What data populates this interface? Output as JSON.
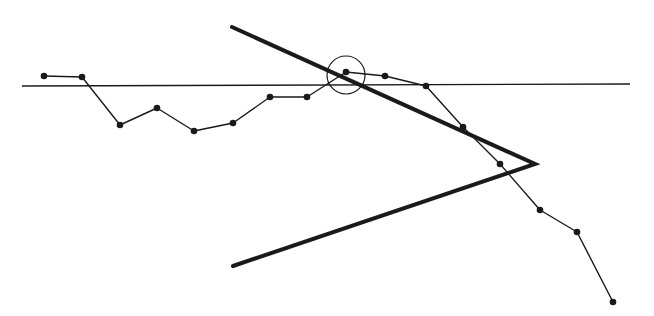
{
  "diagram": {
    "width": 654,
    "height": 316,
    "background": "#ffffff",
    "ink_color": "#1a1a1a",
    "baseline": {
      "x1": 22,
      "y1": 86,
      "x2": 630,
      "y2": 84,
      "stroke_width": 1.3
    },
    "series": {
      "stroke_width": 1.4,
      "marker_radius": 3.3,
      "points": [
        [
          44,
          76
        ],
        [
          82,
          77
        ],
        [
          120,
          125
        ],
        [
          157,
          108
        ],
        [
          194,
          131
        ],
        [
          233,
          123
        ],
        [
          270,
          97
        ],
        [
          307,
          97
        ],
        [
          346,
          72
        ],
        [
          385,
          76
        ],
        [
          426,
          86
        ],
        [
          463,
          127
        ],
        [
          500,
          164
        ],
        [
          540,
          210
        ],
        [
          577,
          232
        ],
        [
          613,
          302
        ]
      ]
    },
    "highlight_circle": {
      "cx": 346,
      "cy": 75,
      "r": 19,
      "stroke_width": 1.2
    },
    "chevron": {
      "stroke_width": 4,
      "points": [
        [
          232,
          27
        ],
        [
          535,
          164
        ],
        [
          233,
          266
        ]
      ]
    }
  }
}
